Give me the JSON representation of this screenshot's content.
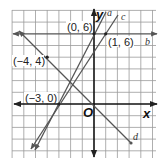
{
  "figure": {
    "type": "coordinate-plane-lines",
    "axes": {
      "x_label": "x",
      "y_label": "y",
      "origin_label": "O"
    },
    "points": [
      {
        "label": "(0, 6)",
        "x": 0,
        "y": 6
      },
      {
        "label": "(1, 6)",
        "x": 1,
        "y": 6
      },
      {
        "label": "(-4, 4)",
        "display": "(−4, 4)",
        "x": -4,
        "y": 4
      },
      {
        "label": "(-3, 0)",
        "display": "(−3, 0)",
        "x": -3,
        "y": 0
      }
    ],
    "lines": [
      {
        "name": "a",
        "through": [
          [
            -3,
            0
          ],
          [
            0,
            6
          ]
        ]
      },
      {
        "name": "b",
        "through": [
          [
            0,
            6
          ],
          [
            1,
            6
          ]
        ]
      },
      {
        "name": "c",
        "through": [
          [
            -3,
            0
          ],
          [
            1,
            6
          ]
        ]
      },
      {
        "name": "d",
        "through": [
          [
            -4,
            4
          ],
          [
            0,
            0
          ]
        ]
      }
    ],
    "labels": {
      "p06": "(0, 6)",
      "p16": "(1, 6)",
      "pm44": "(−4, 4)",
      "pm30": "(−3, 0)",
      "x": "x",
      "y": "y",
      "o": "O",
      "a": "a",
      "b": "b",
      "c": "c",
      "d": "d"
    }
  }
}
